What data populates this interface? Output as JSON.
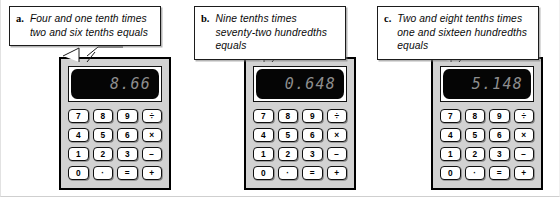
{
  "figure": {
    "panels": [
      {
        "id": "a",
        "letter": "a.",
        "caption": "Four and one tenth times two and six tenths equals",
        "display_value": "8.66"
      },
      {
        "id": "b",
        "letter": "b.",
        "caption": "Nine tenths times seventy-two hundredths equals",
        "display_value": "0.648"
      },
      {
        "id": "c",
        "letter": "c.",
        "caption": "Two and eight tenths times one and sixteen hundredths equals",
        "display_value": "5.148"
      }
    ],
    "calculator": {
      "keys": [
        "7",
        "8",
        "9",
        "÷",
        "4",
        "5",
        "6",
        "×",
        "1",
        "2",
        "3",
        "−",
        "0",
        "·",
        "=",
        "+"
      ]
    }
  }
}
